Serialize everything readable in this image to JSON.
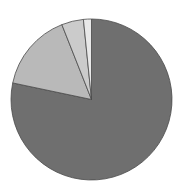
{
  "chart_data": {
    "type": "pie",
    "title": "",
    "legend": [],
    "start_angle_deg": 0,
    "direction": "clockwise",
    "slices": [
      {
        "label": "",
        "value": 78.3,
        "color": "#6f6f6f"
      },
      {
        "label": "",
        "value": 15.7,
        "color": "#b9b9b9"
      },
      {
        "label": "",
        "value": 4.4,
        "color": "#cbcbcb"
      },
      {
        "label": "",
        "value": 1.6,
        "color": "#e8e8e8"
      }
    ],
    "values": [
      78.3,
      15.7,
      4.4,
      1.6
    ],
    "stroke_color": "#4a4a4a"
  },
  "geometry": {
    "cx": 91.5,
    "cy": 99.5,
    "r": 80.5
  }
}
